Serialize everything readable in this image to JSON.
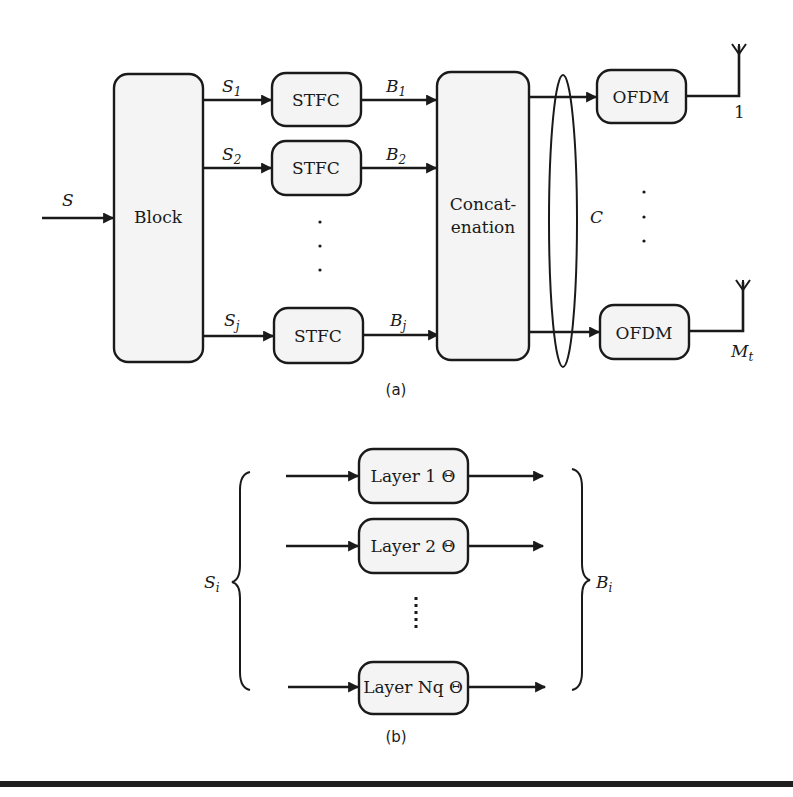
{
  "diagram_a": {
    "caption": "(a)",
    "input_label": "S",
    "block_label": "Block",
    "branches": [
      {
        "input_label": "S",
        "input_sub": "1",
        "stfc_label": "STFC",
        "output_label": "B",
        "output_sub": "1"
      },
      {
        "input_label": "S",
        "input_sub": "2",
        "stfc_label": "STFC",
        "output_label": "B",
        "output_sub": "2"
      },
      {
        "input_label": "S",
        "input_sub": "j",
        "stfc_label": "STFC",
        "output_label": "B",
        "output_sub": "j"
      }
    ],
    "ellipsis": "·",
    "concat_line1": "Concat-",
    "concat_line2": "enation",
    "ellipse_label": "C",
    "ofdm": [
      {
        "label": "OFDM",
        "antenna_label": "1",
        "antenna_sub": ""
      },
      {
        "label": "OFDM",
        "antenna_label": "M",
        "antenna_sub": "t"
      }
    ]
  },
  "diagram_b": {
    "caption": "(b)",
    "left_label": "S",
    "left_sub": "i",
    "right_label": "B",
    "right_sub": "i",
    "layers": [
      {
        "label": "Layer 1 Θ"
      },
      {
        "label": "Layer 2 Θ"
      },
      {
        "label": "Layer Nq Θ"
      }
    ]
  }
}
